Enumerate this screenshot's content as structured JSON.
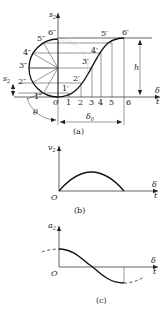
{
  "figure_a": {
    "caption": "(a)",
    "y_axis_label": "s",
    "y_axis_sub": "2",
    "x_axis_label_top": "δ",
    "x_axis_label_bottom": "t",
    "height_label": "h",
    "delta0_label": "δ",
    "delta0_sub": "0",
    "theta_label": "θ",
    "s2_side_label": "s",
    "s2_side_sub": "2",
    "tick_labels": [
      "0",
      "1",
      "2",
      "3",
      "4",
      "5",
      "6"
    ],
    "curve_points": [
      "1′",
      "2′",
      "3′",
      "4′",
      "5′",
      "6′"
    ],
    "circle_points": [
      "1″",
      "2″",
      "3″",
      "4″",
      "5″",
      "6″"
    ]
  },
  "figure_b": {
    "caption": "(b)",
    "y_axis_label": "v",
    "y_axis_sub": "2",
    "origin_label": "O",
    "x_axis_label_top": "δ",
    "x_axis_label_bottom": "t"
  },
  "figure_c": {
    "caption": "(c)",
    "y_axis_label": "a",
    "y_axis_sub": "2",
    "origin_label": "O",
    "x_axis_label_top": "δ",
    "x_axis_label_bottom": "t"
  }
}
